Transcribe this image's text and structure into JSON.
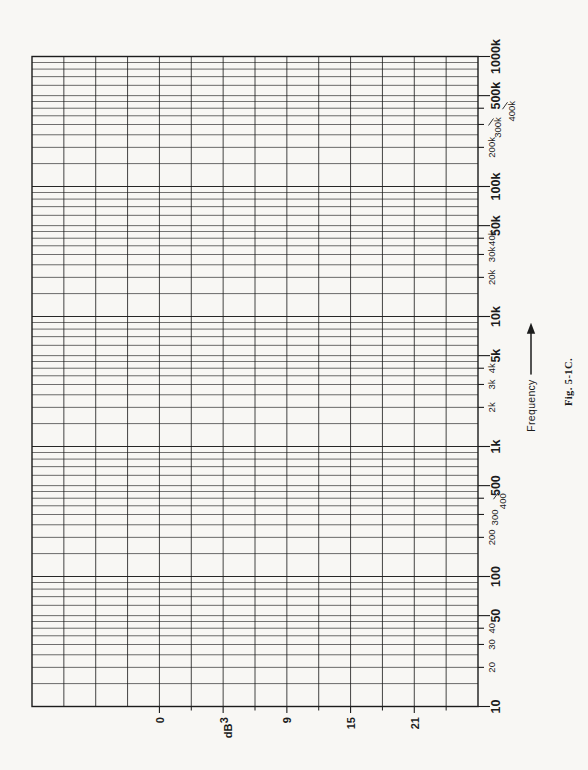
{
  "figure": {
    "caption": "Fig. 5-1C.",
    "freq_axis_title": "Frequency",
    "db_axis_title": "dB"
  },
  "colors": {
    "paper": "#f8f7f4",
    "ink": "#1c1c1c"
  },
  "chart_data": {
    "type": "grid",
    "title": "",
    "orientation": "rotated-90-ccw",
    "freq_axis": {
      "title": "Frequency",
      "scale": "log",
      "min": 10,
      "max": 1000000,
      "decades": 5,
      "ruling_subdivisions": [
        1,
        1.5,
        2,
        2.5,
        3,
        3.5,
        4,
        4.5,
        5,
        6,
        7,
        8,
        9
      ],
      "ticks": [
        {
          "label": "10",
          "value": 10,
          "major": true
        },
        {
          "label": "20",
          "value": 20,
          "major": false
        },
        {
          "label": "30",
          "value": 30,
          "major": false
        },
        {
          "label": "40",
          "value": 40,
          "major": false
        },
        {
          "label": "50",
          "value": 50,
          "major": true
        },
        {
          "label": "100",
          "value": 100,
          "major": true
        },
        {
          "label": "200",
          "value": 200,
          "major": false
        },
        {
          "label": "300",
          "value": 300,
          "major": false,
          "offset": 3
        },
        {
          "label": "400",
          "value": 400,
          "major": false,
          "offset": 11,
          "slash": true
        },
        {
          "label": "500",
          "value": 500,
          "major": true
        },
        {
          "label": "1k",
          "value": 1000,
          "major": true
        },
        {
          "label": "2k",
          "value": 2000,
          "major": false
        },
        {
          "label": "3k",
          "value": 3000,
          "major": false
        },
        {
          "label": "4k",
          "value": 4000,
          "major": false
        },
        {
          "label": "5k",
          "value": 5000,
          "major": true
        },
        {
          "label": "10k",
          "value": 10000,
          "major": true
        },
        {
          "label": "20k",
          "value": 20000,
          "major": false
        },
        {
          "label": "30k",
          "value": 30000,
          "major": false
        },
        {
          "label": "40k",
          "value": 40000,
          "major": false
        },
        {
          "label": "50k",
          "value": 50000,
          "major": true
        },
        {
          "label": "100k",
          "value": 100000,
          "major": true
        },
        {
          "label": "200k",
          "value": 200000,
          "major": false
        },
        {
          "label": "300k",
          "value": 300000,
          "major": false,
          "offset": 6,
          "slash": true
        },
        {
          "label": "400k",
          "value": 400000,
          "major": false,
          "offset": 20,
          "slash": true
        },
        {
          "label": "500k",
          "value": 500000,
          "major": true
        },
        {
          "label": "1000k",
          "value": 1000000,
          "major": true
        }
      ]
    },
    "db_axis": {
      "title": "dB",
      "scale": "linear",
      "divisions": 14,
      "db_per_division": 3,
      "labeled_ticks": [
        {
          "label": "0",
          "line_index": 4
        },
        {
          "label": "3",
          "line_index": 6
        },
        {
          "label": "9",
          "line_index": 8
        },
        {
          "label": "15",
          "line_index": 10
        },
        {
          "label": "21",
          "line_index": 12
        }
      ],
      "minor_tick_line_indices": [
        5,
        7,
        9,
        11,
        13
      ]
    },
    "series": []
  }
}
